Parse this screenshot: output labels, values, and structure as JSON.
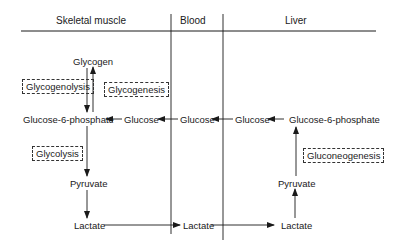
{
  "columns": {
    "skeletal_muscle": "Skeletal muscle",
    "blood": "Blood",
    "liver": "Liver"
  },
  "muscle": {
    "glycogen": "Glycogen",
    "glycogenolysis": "Glycogenolysis",
    "glycogenesis": "Glycogenesis",
    "glucose_6_phosphate": "Glucose-6-phosphate",
    "glucose": "Glucose",
    "glycolysis": "Glycolysis",
    "pyruvate": "Pyruvate",
    "lactate": "Lactate"
  },
  "blood": {
    "glucose": "Glucose",
    "lactate": "Lactate"
  },
  "liver": {
    "glucose": "Glucose",
    "glucose_6_phosphate": "Glucose-6-phosphate",
    "gluconeogenesis": "Gluconeogenesis",
    "pyruvate": "Pyruvate",
    "lactate": "Lactate"
  },
  "colors": {
    "line": "#1a1a1a",
    "background": "#ffffff"
  }
}
